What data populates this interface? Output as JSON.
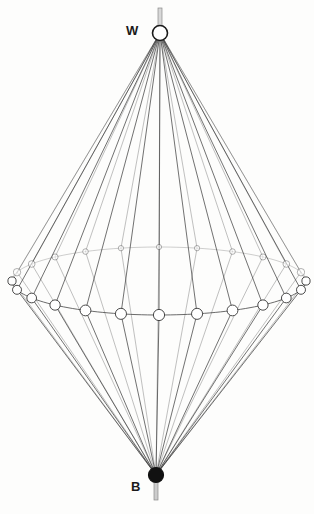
{
  "figure": {
    "background_color": "#fdfdfc",
    "line_color": "#3a3a3a",
    "labels": {
      "top_pole": "W",
      "bottom_pole": "B"
    },
    "poles": {
      "top": {
        "name": "white-pole",
        "x": 160,
        "y": 33,
        "radius": 7.5,
        "fill": "#ffffff",
        "stroke": "#1a1a1a",
        "pin": {
          "x": 160,
          "y_start": 8,
          "y_end": 33,
          "width": 4,
          "fill": "#d8d8d8"
        }
      },
      "bottom": {
        "name": "black-pole",
        "x": 156,
        "y": 475,
        "radius": 7.5,
        "fill": "#111111",
        "stroke": "#111111",
        "pin": {
          "x": 156,
          "y_start": 475,
          "y_end": 500,
          "width": 4,
          "fill": "#cccccc"
        }
      }
    },
    "equator": {
      "name": "equator-ring",
      "center_x": 159,
      "center_y": 281,
      "radius_x": 147,
      "radius_y": 34,
      "front_tilt": 1
    },
    "meridians": {
      "count": 24,
      "stroke_width": 0.7
    },
    "equator_nodes": {
      "count": 24,
      "fill": "#ffffff",
      "stroke": "#2b2b2b",
      "min_radius": 2.6,
      "max_radius": 5.6
    },
    "colors": {
      "accent_line": "#3a3a3a",
      "node_stroke": "#2b2b2b",
      "label_text": "#1a1a1a"
    }
  },
  "chart_data": {
    "type": "scatter",
    "xlabel": "",
    "ylabel": "",
    "legend": [],
    "annotations": [
      "W",
      "B"
    ]
  }
}
